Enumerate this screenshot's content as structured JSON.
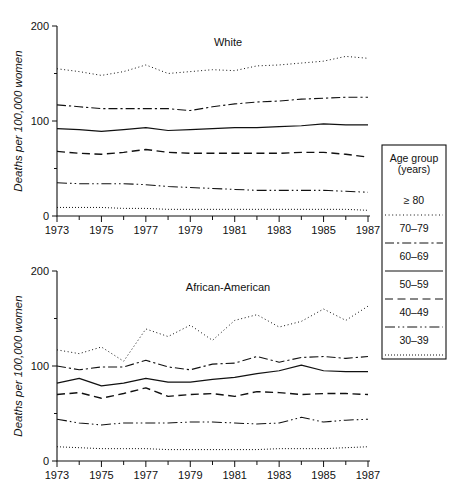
{
  "figure": {
    "panels": [
      {
        "id": "white",
        "title": "White",
        "ylabel": "Deaths per 100,000 women",
        "yticks": [
          "0",
          "100",
          "200"
        ],
        "xticks": [
          "1973",
          "1975",
          "1977",
          "1979",
          "1981",
          "1983",
          "1985",
          "1987"
        ]
      },
      {
        "id": "african-american",
        "title": "African-American",
        "ylabel": "Deaths per 100,000 women",
        "yticks": [
          "0",
          "100",
          "200"
        ],
        "xticks": [
          "1973",
          "1975",
          "1977",
          "1979",
          "1981",
          "1983",
          "1985",
          "1987"
        ]
      }
    ]
  },
  "legend": {
    "title_line1": "Age group",
    "title_line2": "(years)",
    "items": [
      {
        "label": "≥ 80",
        "dash": "1,2.6",
        "width": 1.0
      },
      {
        "label": "70–79",
        "dash": "9,3,2.2,3",
        "width": 1.1
      },
      {
        "label": "60–69",
        "dash": "none",
        "width": 1.25
      },
      {
        "label": "50–59",
        "dash": "8,4.5",
        "width": 1.4
      },
      {
        "label": "40–49",
        "dash": "10,3,1.6,3,1.6,3",
        "width": 1.05
      },
      {
        "label": "30–39",
        "dash": "1,2",
        "width": 1.0
      }
    ]
  },
  "chart_data": {
    "type": "line",
    "xlabel": "",
    "ylabel": "Deaths per 100,000 women",
    "xlim": [
      1973,
      1987
    ],
    "ylim": [
      0,
      200
    ],
    "grid": false,
    "legend_position": "right",
    "x": [
      1973,
      1974,
      1975,
      1976,
      1977,
      1978,
      1979,
      1980,
      1981,
      1982,
      1983,
      1984,
      1985,
      1986,
      1987
    ],
    "panels": [
      {
        "name": "White",
        "series": [
          {
            "name": "≥ 80",
            "values": [
              155,
              152,
              148,
              152,
              159,
              150,
              152,
              154,
              153,
              158,
              159,
              161,
              163,
              168,
              166
            ]
          },
          {
            "name": "70–79",
            "values": [
              117,
              115,
              113,
              113,
              113,
              113,
              111,
              115,
              118,
              120,
              121,
              123,
              124,
              125,
              125
            ]
          },
          {
            "name": "60–69",
            "values": [
              92,
              91,
              89,
              91,
              93,
              90,
              91,
              92,
              93,
              93,
              94,
              95,
              97,
              96,
              96
            ]
          },
          {
            "name": "50–59",
            "values": [
              68,
              66,
              65,
              67,
              70,
              67,
              66,
              66,
              66,
              66,
              66,
              67,
              67,
              65,
              62
            ]
          },
          {
            "name": "40–49",
            "values": [
              35,
              34,
              34,
              34,
              33,
              31,
              30,
              29,
              28,
              27,
              27,
              27,
              27,
              26,
              25
            ]
          },
          {
            "name": "30–39",
            "values": [
              9,
              9,
              9,
              8,
              8,
              7,
              7,
              7,
              7,
              7,
              7,
              7,
              7,
              7,
              6
            ]
          }
        ]
      },
      {
        "name": "African-American",
        "series": [
          {
            "name": "≥ 80",
            "values": [
              117,
              113,
              120,
              105,
              139,
              131,
              143,
              127,
              148,
              154,
              141,
              147,
              160,
              148,
              163
            ]
          },
          {
            "name": "70–79",
            "values": [
              100,
              96,
              99,
              99,
              106,
              99,
              96,
              102,
              103,
              110,
              104,
              109,
              110,
              108,
              110
            ]
          },
          {
            "name": "60–69",
            "values": [
              82,
              87,
              79,
              82,
              87,
              83,
              83,
              86,
              88,
              92,
              95,
              101,
              95,
              94,
              94
            ]
          },
          {
            "name": "50–59",
            "values": [
              70,
              72,
              66,
              71,
              77,
              68,
              70,
              71,
              68,
              73,
              72,
              70,
              71,
              71,
              70
            ]
          },
          {
            "name": "40–49",
            "values": [
              44,
              40,
              38,
              40,
              40,
              40,
              41,
              41,
              40,
              39,
              40,
              46,
              41,
              43,
              44
            ]
          },
          {
            "name": "30–39",
            "values": [
              15,
              14,
              13,
              13,
              13,
              12,
              12,
              12,
              12,
              12,
              13,
              13,
              13,
              14,
              15
            ]
          }
        ]
      }
    ]
  }
}
